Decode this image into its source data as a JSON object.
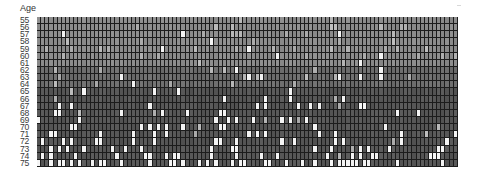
{
  "chart_data": {
    "type": "heatmap",
    "title": "",
    "ylabel": "Age",
    "xlabel": "",
    "y_tick_labels": [
      "55",
      "56",
      "57",
      "58",
      "59",
      "60",
      "61",
      "62",
      "63",
      "64",
      "65",
      "66",
      "67",
      "68",
      "69",
      "70",
      "71",
      "72",
      "73",
      "74",
      "75"
    ],
    "columns": 102,
    "legend": "none",
    "grid": true,
    "value_encoding": "grayscale; white cells = event/high, dark gray = base",
    "colors": {
      "grid_line": "#1c1c1c",
      "upper_band_base": "#8c8c8c",
      "middle_band_base": "#6e6e6e",
      "lower_band_base": "#575757",
      "light_cell": "#b4b4b4",
      "white_cell": "#f4f4f4"
    },
    "bands": [
      {
        "rows": [
          "55",
          "56",
          "57",
          "58",
          "59",
          "60",
          "61"
        ],
        "base": "upper_band_base"
      },
      {
        "rows": [
          "62",
          "63",
          "64"
        ],
        "base": "middle_band_base"
      },
      {
        "rows": [
          "65",
          "66",
          "67",
          "68",
          "69",
          "70",
          "71",
          "72",
          "73",
          "74",
          "75"
        ],
        "base": "lower_band_base"
      }
    ],
    "white_cell_fraction_by_row": {
      "55": 0.01,
      "56": 0.01,
      "57": 0.015,
      "58": 0.01,
      "59": 0.02,
      "60": 0.02,
      "61": 0.02,
      "62": 0.04,
      "63": 0.03,
      "64": 0.04,
      "65": 0.05,
      "66": 0.05,
      "67": 0.1,
      "68": 0.1,
      "69": 0.11,
      "70": 0.12,
      "71": 0.13,
      "72": 0.15,
      "73": 0.18,
      "74": 0.2,
      "75": 0.42
    },
    "light_cell_fraction_by_row": {
      "55": 0.04,
      "56": 0.05,
      "57": 0.05,
      "58": 0.05,
      "59": 0.05,
      "60": 0.05,
      "61": 0.05,
      "62": 0.06,
      "63": 0.06,
      "64": 0.05,
      "65": 0.02,
      "66": 0.02,
      "67": 0.01,
      "68": 0.01,
      "69": 0.01,
      "70": 0.01,
      "71": 0.01,
      "72": 0.01,
      "73": 0.01,
      "74": 0.01,
      "75": 0.0
    },
    "render_seed": 7
  }
}
